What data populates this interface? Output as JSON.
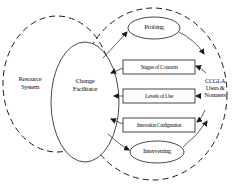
{
  "diagram": {
    "resource_system": {
      "line1": "Resource",
      "line2": "System"
    },
    "change_facilitator": {
      "line1": "Change",
      "line2": "Facilitator"
    },
    "probing": "Probing",
    "stages_of_concern": "Stages of Concern",
    "levels_of_use": "Levels of Use",
    "innovation_configuration": "Innovation Configuration",
    "intervening": "Intervening",
    "users": {
      "line1": "CCGLA",
      "line2": "Users &",
      "line3": "Nonusers"
    },
    "colors": {
      "stroke": "#1a1a1a",
      "background": "#ffffff"
    }
  }
}
